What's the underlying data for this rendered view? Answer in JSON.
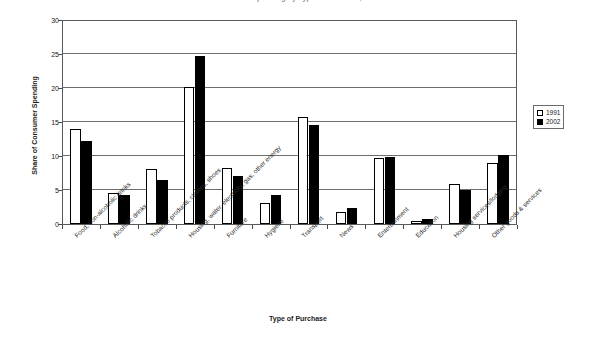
{
  "chart_data": {
    "type": "bar",
    "title": "Share of Consumer Spending by Type of Purchase, 1991 and 2002",
    "xlabel": "Type of Purchase",
    "ylabel": "Share of Consumer Spending",
    "ylim": [
      0,
      30
    ],
    "yticks": [
      0,
      5,
      10,
      15,
      20,
      25,
      30
    ],
    "grid": true,
    "legend_position": "right",
    "categories": [
      "Food, non-alcoholic drinks",
      "Alcoholic drinks",
      "Tobacco products, clothes, shoes",
      "Housing, water, electricity, gas, other energy",
      "Furniture",
      "Hygiene",
      "Transport",
      "News",
      "Entertainment",
      "Education",
      "Housing services/lodging",
      "Other goods & services"
    ],
    "series": [
      {
        "name": "1991",
        "color": "#ffffff",
        "values": [
          14.0,
          4.5,
          8.1,
          20.2,
          8.2,
          3.1,
          15.8,
          1.8,
          9.7,
          0.4,
          5.9,
          9.0
        ]
      },
      {
        "name": "2002",
        "color": "#000000",
        "values": [
          12.2,
          4.2,
          6.4,
          24.7,
          7.1,
          4.2,
          14.6,
          2.3,
          9.8,
          0.7,
          5.0,
          10.2
        ]
      }
    ]
  },
  "legend": {
    "items": [
      {
        "label": "1991"
      },
      {
        "label": "2002"
      }
    ]
  }
}
